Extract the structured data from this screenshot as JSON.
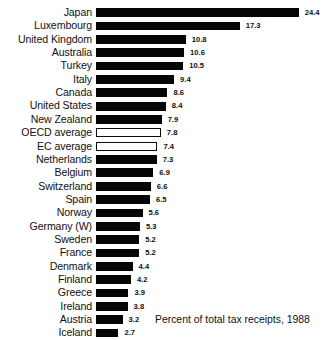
{
  "chart_data": {
    "type": "bar",
    "orientation": "horizontal",
    "title": "",
    "xlabel": "Percent of total tax receipts, 1988",
    "ylabel": "",
    "xlim": [
      0,
      24.4
    ],
    "grid": false,
    "legend": null,
    "categories": [
      "Japan",
      "Luxembourg",
      "United Kingdom",
      "Australia",
      "Turkey",
      "Italy",
      "Canada",
      "United States",
      "New Zealand",
      "OECD average",
      "EC average",
      "Netherlands",
      "Belgium",
      "Switzerland",
      "Spain",
      "Norway",
      "Germany (W)",
      "Sweden",
      "France",
      "Denmark",
      "Finland",
      "Greece",
      "Ireland",
      "Austria",
      "Iceland"
    ],
    "values": [
      24.4,
      17.3,
      10.8,
      10.6,
      10.5,
      9.4,
      8.6,
      8.4,
      7.9,
      7.8,
      7.4,
      7.3,
      6.9,
      6.6,
      6.5,
      5.6,
      5.3,
      5.2,
      5.2,
      4.4,
      4.2,
      3.9,
      3.8,
      3.2,
      2.7
    ],
    "value_labels": [
      "24.4",
      "17.3",
      "10.8",
      "10.6",
      "10.5",
      "9.4",
      "8.6",
      "8.4",
      "7.9",
      "7.8",
      "7.4",
      "7.3",
      "6.9",
      "6.6",
      "6.5",
      "5.6",
      "5.3",
      "5.2",
      "5.2",
      "4.4",
      "4.2",
      "3.9",
      "3.8",
      "3.2",
      "2.7"
    ],
    "bar_styles": [
      "solid",
      "solid",
      "solid",
      "solid",
      "solid",
      "solid",
      "solid",
      "solid",
      "solid",
      "hollow",
      "hollow",
      "solid",
      "solid",
      "solid",
      "solid",
      "solid",
      "solid",
      "solid",
      "solid",
      "solid",
      "solid",
      "solid",
      "solid",
      "solid",
      "solid"
    ],
    "colors": {
      "bar_fill": "#050505",
      "bar_outline": "#0a0a0a",
      "background": "#ffffff",
      "text": "#111111"
    }
  },
  "caption": {
    "text": "Percent of total tax receipts, 1988"
  }
}
